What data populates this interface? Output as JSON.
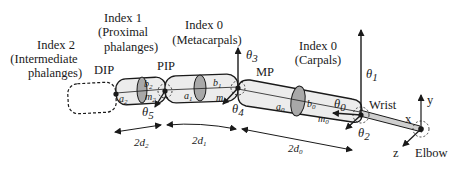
{
  "diagram": {
    "segments": [
      {
        "id": "index2",
        "title": "Index 2",
        "subtitle": "(Intermediate",
        "subtitle2": "phalanges)"
      },
      {
        "id": "index1",
        "title": "Index 1",
        "subtitle": "(Proximal",
        "subtitle2": "phalanges)"
      },
      {
        "id": "index0m",
        "title": "Index 0",
        "subtitle": "(Metacarpals)"
      },
      {
        "id": "index0c",
        "title": "Index 0",
        "subtitle": "(Carpals)"
      }
    ],
    "joints": {
      "dip": "DIP",
      "pip": "PIP",
      "mp": "MP",
      "wrist": "Wrist",
      "elbow": "Elbow"
    },
    "angles": {
      "t0": "θ",
      "t0_sub": "0",
      "t1": "θ",
      "t1_sub": "1",
      "t2": "θ",
      "t2_sub": "2",
      "t3": "θ",
      "t3_sub": "3",
      "t4": "θ",
      "t4_sub": "4",
      "t5": "θ",
      "t5_sub": "5"
    },
    "vars": {
      "a2": "a",
      "a2s": "2",
      "b2": "b",
      "b2s": "2",
      "m2": "m",
      "m2s": "2",
      "a1": "a",
      "a1s": "1",
      "b1": "b",
      "b1s": "1",
      "m1": "m",
      "m1s": "1",
      "a0": "a",
      "a0s": "0",
      "b0": "b",
      "b0s": "0",
      "m0": "m",
      "m0s": "0"
    },
    "dimensions": {
      "d2": "2d",
      "d2s": "2",
      "d1": "2d",
      "d1s": "1",
      "d0": "2d",
      "d0s": "0"
    },
    "axes": {
      "x": "x",
      "y": "y",
      "z": "z"
    },
    "colors": {
      "ink": "#1a1a1a",
      "fill_light": "#ececec",
      "fill_ellipse": "#a8a8a8",
      "background": "#ffffff"
    }
  }
}
